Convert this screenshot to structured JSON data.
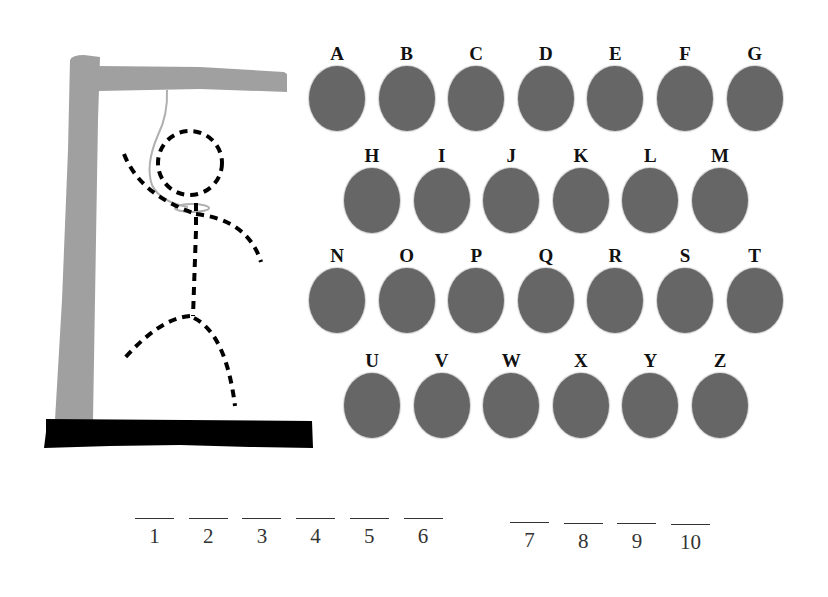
{
  "colors": {
    "background": "#ffffff",
    "gallows_wood": "#a0a0a0",
    "base": "#000000",
    "rope": "#b0b0b0",
    "figure_dashes": "#000000",
    "letter_button": "#666666",
    "letter_label": "#111111"
  },
  "gallows": {
    "post": "vertical-post",
    "beam": "top-beam",
    "base": "ground-base",
    "rope": "noose"
  },
  "figure": {
    "parts_shown": [
      "head",
      "body",
      "left-arm",
      "right-arm",
      "left-leg",
      "right-leg"
    ],
    "style": "dashed"
  },
  "keyboard": {
    "rows": [
      [
        "A",
        "B",
        "C",
        "D",
        "E",
        "F",
        "G"
      ],
      [
        "H",
        "I",
        "J",
        "K",
        "L",
        "M"
      ],
      [
        "N",
        "O",
        "P",
        "Q",
        "R",
        "S",
        "T"
      ],
      [
        "U",
        "V",
        "W",
        "X",
        "Y",
        "Z"
      ]
    ]
  },
  "word": {
    "groups": [
      [
        "1",
        "2",
        "3",
        "4",
        "5",
        "6"
      ],
      [
        "7",
        "8",
        "9",
        "10"
      ]
    ],
    "revealed": [
      "",
      "",
      "",
      "",
      "",
      "",
      "",
      "",
      "",
      ""
    ]
  }
}
